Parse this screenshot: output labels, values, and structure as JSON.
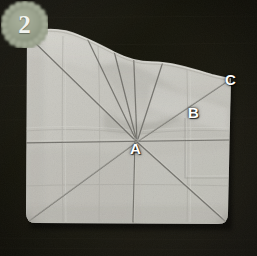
{
  "scene": {
    "title": "Paper folding step 2 — creased square with radial folds",
    "kind": "instructional-photo",
    "width": 257,
    "height": 256
  },
  "badge": {
    "name": "step-number-badge",
    "number": "2",
    "shape": "scalloped-circle",
    "fill_color": "#98a08b",
    "text_color": "#f2f3ef",
    "center": [
      24,
      24
    ],
    "radius": 21
  },
  "colors": {
    "background_dark": "#17160f",
    "background_edge": "#2b2922",
    "paper_light": "#c9c8c1",
    "paper_mid": "#bfbeb6",
    "paper_shadow": "#a9a8a1",
    "paper_highlight": "#d6d5cf",
    "crease_line": "#6d6c66",
    "label_text": "#ffffff"
  },
  "labels": [
    {
      "id": "A",
      "text": "A",
      "x": 137,
      "y": 148,
      "role": "fold-convergence-point"
    },
    {
      "id": "B",
      "text": "B",
      "x": 195,
      "y": 112,
      "role": "diagonal-midpoint"
    },
    {
      "id": "C",
      "text": "C",
      "x": 232,
      "y": 80,
      "role": "upper-right-corner-point"
    }
  ],
  "paper": {
    "name": "folded-paper-sheet",
    "corners": {
      "top_left": [
        27,
        33
      ],
      "top_right": [
        231,
        79
      ],
      "bottom_right": [
        228,
        224
      ],
      "bottom_left": [
        26,
        223
      ]
    },
    "top_edge_wavy": true
  },
  "creases": {
    "origin": [
      137,
      142
    ],
    "count": 10,
    "radial_endpoints": [
      [
        27,
        33
      ],
      [
        26,
        223
      ],
      [
        228,
        224
      ],
      [
        231,
        79
      ],
      [
        88,
        35
      ],
      [
        111,
        34
      ],
      [
        133,
        222
      ],
      [
        25,
        142
      ],
      [
        229,
        142
      ],
      [
        170,
        38
      ]
    ],
    "horizontal_y": 142,
    "vertical_x": 133
  }
}
